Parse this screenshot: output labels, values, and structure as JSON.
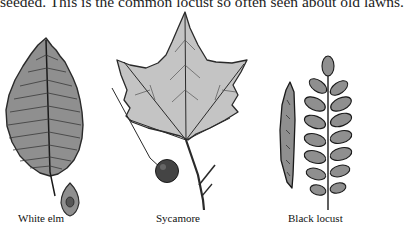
{
  "page": {
    "text_line": "seeded.  This is the common locust so often seen about old lawns."
  },
  "figures": [
    {
      "id": "white-elm",
      "caption": "White elm",
      "parts": [
        "leaf",
        "winged-seed"
      ]
    },
    {
      "id": "sycamore",
      "caption": "Sycamore",
      "parts": [
        "leaf",
        "seed-ball",
        "twig"
      ]
    },
    {
      "id": "black-locust",
      "caption": "Black locust",
      "parts": [
        "seed-pod",
        "compound-leaf"
      ]
    }
  ],
  "colors": {
    "leaf_fill_dark": "#8f8f8f",
    "leaf_fill_light": "#c4c4c4",
    "outline": "#2a2a2a",
    "background": "#ffffff"
  }
}
